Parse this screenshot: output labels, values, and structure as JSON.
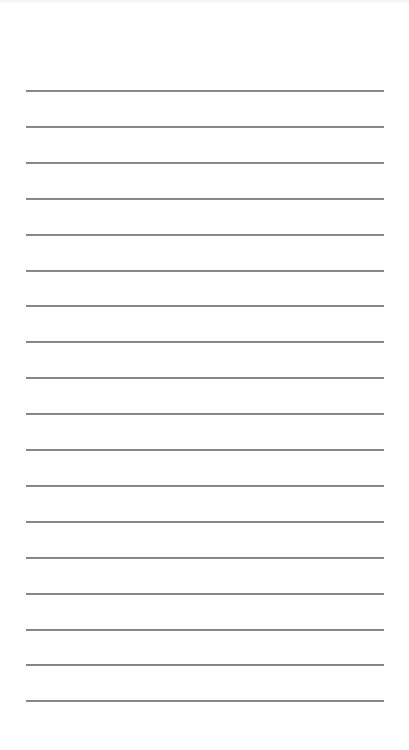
{
  "document": {
    "type": "lined-paper",
    "background_color": "#ffffff",
    "rule_color": "#777777",
    "text_content": ""
  },
  "rules": {
    "count": 18,
    "left": 26,
    "right": 384,
    "first_y": 91,
    "spacing": 35.9,
    "thickness": 2
  }
}
